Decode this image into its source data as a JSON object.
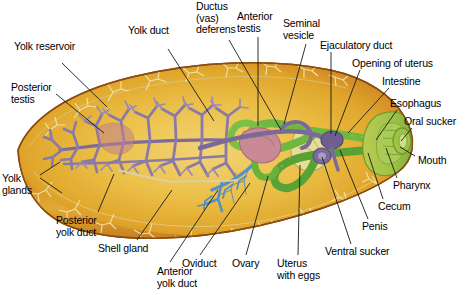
{
  "figure": {
    "organism": "parasitic flatworm (fluke)",
    "background_color": "#ffffff",
    "text_color": "#000000",
    "leader_line_color": "#1a1a1a"
  },
  "palette": {
    "body_fill_center": "#e9ba3c",
    "body_fill_light": "#f0cf6a",
    "body_rim_orange": "#c9781f",
    "body_rim_dark": "#a85f16",
    "body_outline": "#8a4c10",
    "yolk_gland_purple": "#8b7aa8",
    "yolk_gland_purple_dark": "#6d5c8c",
    "yolk_duct_pale": "#efe3b0",
    "ovary_blue": "#5a8fc0",
    "intestine_green": "#5aa83c",
    "intestine_green_light": "#8cc24a",
    "head_green": "#9ec44a",
    "testis_pink": "#c98a95",
    "testis_pink_dark": "#b0707f",
    "uterus_cream": "#e8dc9a",
    "duct_purple": "#7a6a9a"
  },
  "labels": [
    {
      "id": "yolk-reservoir",
      "text": "Yolk reservoir",
      "x": 14,
      "y": 41,
      "align": "left"
    },
    {
      "id": "yolk-duct",
      "text": "Yolk duct",
      "x": 128,
      "y": 25,
      "align": "left"
    },
    {
      "id": "ductus-vas-deferens",
      "text": "Ductus\n(vas)\ndeferens",
      "x": 196,
      "y": 1,
      "align": "left"
    },
    {
      "id": "anterior-testis",
      "text": "Anterior\ntestis",
      "x": 237,
      "y": 11,
      "align": "left"
    },
    {
      "id": "seminal-vesicle",
      "text": "Seminal\nvesicle",
      "x": 283,
      "y": 18,
      "align": "left"
    },
    {
      "id": "ejaculatory-duct",
      "text": "Ejaculatory duct",
      "x": 320,
      "y": 40,
      "align": "left"
    },
    {
      "id": "opening-of-uterus",
      "text": "Opening of uterus",
      "x": 352,
      "y": 58,
      "align": "left"
    },
    {
      "id": "intestine",
      "text": "Intestine",
      "x": 382,
      "y": 76,
      "align": "left"
    },
    {
      "id": "esophagus",
      "text": "Esophagus",
      "x": 390,
      "y": 98,
      "align": "left"
    },
    {
      "id": "oral-sucker",
      "text": "Oral sucker",
      "x": 404,
      "y": 116,
      "align": "left"
    },
    {
      "id": "mouth",
      "text": "Mouth",
      "x": 418,
      "y": 155,
      "align": "left"
    },
    {
      "id": "pharynx",
      "text": "Pharynx",
      "x": 393,
      "y": 180,
      "align": "left"
    },
    {
      "id": "cecum",
      "text": "Cecum",
      "x": 378,
      "y": 201,
      "align": "left"
    },
    {
      "id": "penis",
      "text": "Penis",
      "x": 362,
      "y": 221,
      "align": "left"
    },
    {
      "id": "ventral-sucker",
      "text": "Ventral sucker",
      "x": 325,
      "y": 246,
      "align": "left"
    },
    {
      "id": "uterus-with-eggs",
      "text": "Uterus\nwith eggs",
      "x": 277,
      "y": 258,
      "align": "left"
    },
    {
      "id": "ovary",
      "text": "Ovary",
      "x": 232,
      "y": 258,
      "align": "left"
    },
    {
      "id": "oviduct",
      "text": "Oviduct",
      "x": 182,
      "y": 258,
      "align": "left"
    },
    {
      "id": "anterior-yolk-duct",
      "text": "Anterior\nyolk duct",
      "x": 157,
      "y": 266,
      "align": "left"
    },
    {
      "id": "shell-gland",
      "text": "Shell gland",
      "x": 98,
      "y": 243,
      "align": "left"
    },
    {
      "id": "posterior-yolk-duct",
      "text": "Posterior\nyolk duct",
      "x": 56,
      "y": 215,
      "align": "left"
    },
    {
      "id": "yolk-glands",
      "text": "Yolk\nglands",
      "x": 2,
      "y": 173,
      "align": "left"
    },
    {
      "id": "posterior-testis",
      "text": "Posterior\ntestis",
      "x": 11,
      "y": 82,
      "align": "left"
    }
  ],
  "leader_lines": [
    {
      "id": "leader-yolk-reservoir",
      "points": "62,63 107,107"
    },
    {
      "id": "leader-yolk-duct",
      "points": "168,49 214,121"
    },
    {
      "id": "leader-ductus-vas-deferens",
      "points": "229,40 281,130"
    },
    {
      "id": "leader-anterior-testis",
      "points": "258,37 258,126"
    },
    {
      "id": "leader-seminal-vesicle",
      "points": "306,44 284,124"
    },
    {
      "id": "leader-ejaculatory-duct",
      "points": "331,52 331,134"
    },
    {
      "id": "leader-opening-of-uterus",
      "points": "360,70 335,136"
    },
    {
      "id": "leader-intestine",
      "points": "389,88 348,133"
    },
    {
      "id": "leader-esophagus",
      "points": "397,110 376,140"
    },
    {
      "id": "leader-oral-sucker",
      "points": "412,128 401,141"
    },
    {
      "id": "leader-mouth",
      "points": "415,156 400,147"
    },
    {
      "id": "leader-pharynx",
      "points": "397,178 386,148"
    },
    {
      "id": "leader-cecum",
      "points": "383,199 368,153"
    },
    {
      "id": "leader-penis",
      "points": "368,219 340,150"
    },
    {
      "id": "leader-ventral-sucker",
      "points": "351,244 322,157"
    },
    {
      "id": "leader-uterus-with-eggs",
      "points": "298,255 300,165"
    },
    {
      "id": "leader-ovary",
      "points": "246,255 268,176"
    },
    {
      "id": "leader-oviduct",
      "points": "200,255 250,183"
    },
    {
      "id": "leader-anterior-yolk-duct",
      "points": "170,262 218,190"
    },
    {
      "id": "leader-shell-gland",
      "points": "137,240 172,190"
    },
    {
      "id": "leader-posterior-yolk-duct",
      "points": "98,212 114,174"
    },
    {
      "id": "leader-yolk-glands-a",
      "points": "40,175 60,162"
    },
    {
      "id": "leader-yolk-glands-b",
      "points": "40,178 62,193"
    },
    {
      "id": "leader-posterior-testis",
      "points": "56,94 104,133"
    }
  ],
  "structures": [
    {
      "id": "body-outline",
      "name": "fluke body outline",
      "color": "#e9ba3c"
    },
    {
      "id": "body-rim",
      "name": "body wall / tegument rim",
      "color": "#c9781f"
    },
    {
      "id": "yolk-glands",
      "name": "vitelline (yolk) glands",
      "color": "#8b7aa8"
    },
    {
      "id": "yolk-ducts",
      "name": "yolk ducts",
      "color": "#efe3b0"
    },
    {
      "id": "ovary-branch",
      "name": "ovary branching duct",
      "color": "#5a8fc0"
    },
    {
      "id": "intestine",
      "name": "intestinal ceca",
      "color": "#5aa83c"
    },
    {
      "id": "testes",
      "name": "anterior and posterior testes",
      "color": "#c98a95"
    },
    {
      "id": "head-region",
      "name": "oral sucker / pharynx region",
      "color": "#9ec44a"
    },
    {
      "id": "uterus",
      "name": "uterus with eggs",
      "color": "#e8dc9a"
    },
    {
      "id": "vas-deferens",
      "name": "ductus (vas) deferens",
      "color": "#7a6a9a"
    }
  ]
}
